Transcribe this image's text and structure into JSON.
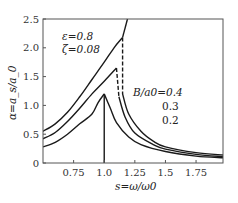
{
  "chart_data": {
    "type": "line",
    "title": "",
    "xlabel": "s=ω/ω0",
    "ylabel": "α=a_s/a_0",
    "xlim": [
      0.5,
      1.97
    ],
    "ylim": [
      0,
      2.5
    ],
    "x_ticks": [
      "0.75",
      "1.0",
      "1.25",
      "1.5",
      "1.75"
    ],
    "x_tick_values": [
      0.75,
      1.0,
      1.25,
      1.5,
      1.75
    ],
    "y_ticks": [
      "0",
      "0.5",
      "1.0",
      "1.5",
      "2.0",
      "2.5"
    ],
    "y_tick_values": [
      0,
      0.5,
      1.0,
      1.5,
      2.0,
      2.5
    ],
    "grid": false,
    "annotations": {
      "params_line1": "ε=0.8",
      "params_line2": "ζ=0.08",
      "legend_title": "B/a0=0.4",
      "legend_values": [
        "0.3",
        "0.2"
      ]
    },
    "series": [
      {
        "name": "B/a0=0.4",
        "left_branch": [
          [
            0.5,
            0.55
          ],
          [
            0.6,
            0.68
          ],
          [
            0.7,
            0.88
          ],
          [
            0.8,
            1.15
          ],
          [
            0.9,
            1.45
          ],
          [
            1.0,
            1.75
          ],
          [
            1.08,
            2.0
          ],
          [
            1.15,
            2.18
          ]
        ],
        "upper_line": [
          [
            1.15,
            2.18
          ],
          [
            1.19,
            2.5
          ]
        ],
        "unstable_dashed": [
          [
            1.15,
            2.18
          ],
          [
            1.15,
            1.2
          ]
        ],
        "right_branch": [
          [
            1.15,
            1.2
          ],
          [
            1.2,
            0.85
          ],
          [
            1.3,
            0.55
          ],
          [
            1.4,
            0.38
          ],
          [
            1.5,
            0.28
          ],
          [
            1.75,
            0.18
          ],
          [
            1.97,
            0.14
          ]
        ]
      },
      {
        "name": "B/a0=0.3",
        "left_branch": [
          [
            0.5,
            0.42
          ],
          [
            0.6,
            0.53
          ],
          [
            0.7,
            0.72
          ],
          [
            0.8,
            0.95
          ],
          [
            0.9,
            1.2
          ],
          [
            1.0,
            1.42
          ],
          [
            1.1,
            1.65
          ]
        ],
        "unstable_dashed": [
          [
            1.1,
            1.65
          ],
          [
            1.12,
            1.15
          ]
        ],
        "right_branch": [
          [
            1.12,
            1.15
          ],
          [
            1.17,
            0.8
          ],
          [
            1.25,
            0.52
          ],
          [
            1.4,
            0.32
          ],
          [
            1.5,
            0.24
          ],
          [
            1.75,
            0.15
          ],
          [
            1.97,
            0.11
          ]
        ]
      },
      {
        "name": "B/a0=0.2",
        "left_branch": [
          [
            0.5,
            0.28
          ],
          [
            0.6,
            0.36
          ],
          [
            0.7,
            0.5
          ],
          [
            0.8,
            0.68
          ],
          [
            0.9,
            0.85
          ],
          [
            0.95,
            1.05
          ],
          [
            1.0,
            1.2
          ]
        ],
        "vertical_drop": [
          [
            1.0,
            1.2
          ],
          [
            1.0,
            0.0
          ]
        ],
        "unstable_dashed": [],
        "right_branch": [
          [
            1.0,
            1.2
          ],
          [
            1.05,
            0.95
          ],
          [
            1.1,
            0.7
          ],
          [
            1.2,
            0.45
          ],
          [
            1.3,
            0.32
          ],
          [
            1.5,
            0.2
          ],
          [
            1.75,
            0.12
          ],
          [
            1.97,
            0.09
          ]
        ]
      }
    ]
  }
}
